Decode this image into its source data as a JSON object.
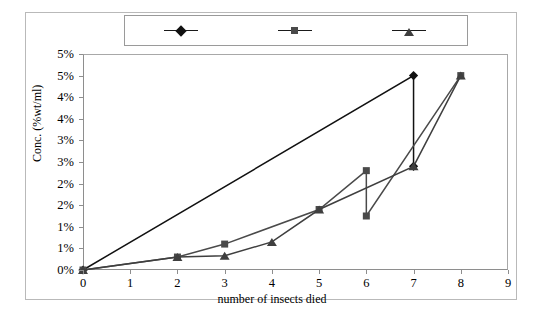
{
  "chart_data": {
    "type": "line",
    "title": "",
    "xlabel": "number of insects died",
    "ylabel": "Conc. (%wt/ml)",
    "xlim": [
      0,
      9
    ],
    "ylim": [
      0,
      5
    ],
    "xticks": [
      "0",
      "1",
      "2",
      "3",
      "4",
      "5",
      "6",
      "7",
      "8",
      "9"
    ],
    "xtick_values": [
      0,
      1,
      2,
      3,
      4,
      5,
      6,
      7,
      8,
      9
    ],
    "yticks": [
      "0%",
      "1%",
      "1%",
      "2%",
      "2%",
      "3%",
      "3%",
      "4%",
      "4%",
      "5%"
    ],
    "ytick_values": [
      0,
      0.5,
      1,
      1.5,
      2,
      2.5,
      3,
      3.5,
      4,
      4.5,
      5
    ],
    "ytick_labels_full": [
      "0%",
      "1%",
      "1%",
      "2%",
      "2%",
      "3%",
      "3%",
      "4%",
      "4%",
      "5%"
    ],
    "grid": false,
    "legend_position": "top-center",
    "series": [
      {
        "name": "First trial",
        "marker": "diamond",
        "color": "#111111",
        "points": [
          {
            "x": 0,
            "y": 0
          },
          {
            "x": 7,
            "y": 4.5
          },
          {
            "x": 7,
            "y": 2.4
          }
        ]
      },
      {
        "name": "Second trial",
        "marker": "square",
        "color": "#4a4a4a",
        "points": [
          {
            "x": 0,
            "y": 0
          },
          {
            "x": 2,
            "y": 0.3
          },
          {
            "x": 3,
            "y": 0.6
          },
          {
            "x": 5,
            "y": 1.4
          },
          {
            "x": 6,
            "y": 2.3
          },
          {
            "x": 6,
            "y": 1.25
          },
          {
            "x": 8,
            "y": 4.5
          }
        ]
      },
      {
        "name": "Third trial",
        "marker": "triangle",
        "color": "#3f3f3f",
        "points": [
          {
            "x": 0,
            "y": 0
          },
          {
            "x": 2,
            "y": 0.3
          },
          {
            "x": 3,
            "y": 0.33
          },
          {
            "x": 4,
            "y": 0.65
          },
          {
            "x": 5,
            "y": 1.4
          },
          {
            "x": 7,
            "y": 2.4
          },
          {
            "x": 8,
            "y": 4.5
          }
        ]
      }
    ]
  },
  "legend": {
    "entries": [
      {
        "label": "First trial",
        "marker": "diamond"
      },
      {
        "label": "Second trial",
        "marker": "square"
      },
      {
        "label": "Third trial",
        "marker": "triangle"
      }
    ]
  },
  "axes": {
    "y_title": "Conc. (%wt/ml)",
    "x_title": "number of insects died"
  },
  "colors": {
    "first_trial": "#111111",
    "second_trial": "#4a4a4a",
    "third_trial": "#3f3f3f",
    "axis": "#8e8e8e",
    "frame": "#b9b9b9",
    "background": "#ffffff"
  }
}
